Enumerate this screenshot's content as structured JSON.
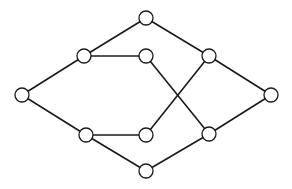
{
  "diagram": {
    "type": "undirected-graph",
    "node_radius": 7,
    "colors": {
      "stroke": "#1a1a1a",
      "fill": "#ffffff",
      "background": "#ffffff"
    },
    "nodes": [
      {
        "id": "A",
        "x": 22,
        "y": 95
      },
      {
        "id": "B",
        "x": 146,
        "y": 18
      },
      {
        "id": "C",
        "x": 84,
        "y": 56
      },
      {
        "id": "D",
        "x": 146,
        "y": 56
      },
      {
        "id": "E",
        "x": 209,
        "y": 56
      },
      {
        "id": "F",
        "x": 271,
        "y": 95
      },
      {
        "id": "G",
        "x": 86,
        "y": 135
      },
      {
        "id": "H",
        "x": 146,
        "y": 135
      },
      {
        "id": "I",
        "x": 209,
        "y": 134
      },
      {
        "id": "J",
        "x": 146,
        "y": 171
      }
    ],
    "edges": [
      [
        "A",
        "C"
      ],
      [
        "A",
        "G"
      ],
      [
        "C",
        "B"
      ],
      [
        "C",
        "D"
      ],
      [
        "B",
        "E"
      ],
      [
        "E",
        "F"
      ],
      [
        "D",
        "I"
      ],
      [
        "E",
        "H"
      ],
      [
        "G",
        "H"
      ],
      [
        "G",
        "J"
      ],
      [
        "J",
        "I"
      ],
      [
        "I",
        "F"
      ]
    ]
  }
}
